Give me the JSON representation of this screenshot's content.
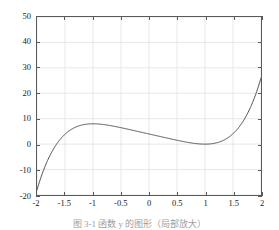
{
  "figure": {
    "caption": "图 3-1 函数 y 的图形（局部放大）",
    "background_color": "#ffffff",
    "axis_color": "#5a5a5a",
    "grid_color": "#e2e2e2",
    "curve_color": "#4d4d4d",
    "tick_label_color": "#1a1a1a"
  },
  "chart_data": {
    "type": "line",
    "title": "",
    "xlabel": "",
    "ylabel": "",
    "xlim": [
      -2,
      2
    ],
    "ylim": [
      -20,
      50
    ],
    "grid": true,
    "legend": null,
    "legend_position": "none",
    "xticks": [
      -2,
      -1.5,
      -1,
      -0.5,
      0,
      0.5,
      1,
      1.5,
      2
    ],
    "xticklabels": [
      "-2",
      "-1.5",
      "-1",
      "-0.5",
      "0",
      "0.5",
      "1",
      "1.5",
      "2"
    ],
    "yticks": [
      -20,
      -10,
      0,
      10,
      20,
      30,
      40,
      50
    ],
    "yticklabels": [
      "-20",
      "-10",
      "0",
      "10",
      "20",
      "30",
      "40",
      "50"
    ],
    "series": [
      {
        "name": "y = x^5 - 5x + 4",
        "color": "#4d4d4d",
        "linewidth": 1,
        "x": [
          -2,
          -1.9,
          -1.8,
          -1.7,
          -1.6,
          -1.5,
          -1.4,
          -1.3,
          -1.2,
          -1.1,
          -1,
          -0.9,
          -0.8,
          -0.7,
          -0.6,
          -0.5,
          -0.4,
          -0.3,
          -0.2,
          -0.1,
          0,
          0.1,
          0.2,
          0.3,
          0.4,
          0.5,
          0.6,
          0.7,
          0.8,
          0.9,
          1,
          1.1,
          1.2,
          1.3,
          1.4,
          1.5,
          1.6,
          1.7,
          1.8,
          1.9,
          2
        ],
        "y": [
          -18,
          -10.28,
          -4.89,
          -1.35,
          0.51,
          1.91,
          3.62,
          4.79,
          5.51,
          5.89,
          6,
          5.91,
          5.67,
          5.33,
          4.92,
          4.47,
          4.0,
          3.5,
          3.0,
          2.5,
          4.0,
          3.5,
          3.0,
          2.5,
          2.01,
          1.53,
          1.08,
          0.67,
          0.33,
          0.09,
          0,
          0.11,
          0.49,
          1.21,
          2.38,
          4.09,
          6.49,
          9.71,
          13.9,
          19.27,
          26
        ]
      }
    ],
    "annotations": []
  }
}
